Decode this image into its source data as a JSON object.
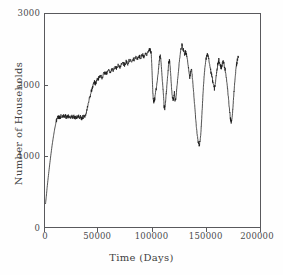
{
  "chart_data": {
    "type": "line",
    "title": "",
    "xlabel": "Time (Days)",
    "ylabel": "Number of Households",
    "xlim": [
      0,
      200000
    ],
    "ylim": [
      0,
      3000
    ],
    "xticks": [
      0,
      50000,
      100000,
      150000,
      200000
    ],
    "xtick_labels": [
      "0",
      "50000",
      "100000",
      "150000",
      "200000"
    ],
    "yticks": [
      0,
      1000,
      2000,
      3000
    ],
    "ytick_labels": [
      "0",
      "1000",
      "2000",
      "3000"
    ],
    "grid": false,
    "legend": false,
    "line_color": "#1a1a1a",
    "series": [
      {
        "name": "Number of Households",
        "x": [
          500,
          1200,
          2000,
          3000,
          4200,
          5400,
          6600,
          7800,
          9000,
          10200,
          11000,
          11800,
          12600,
          13400,
          14200,
          15000,
          16000,
          17000,
          18000,
          19000,
          20000,
          21000,
          22000,
          23000,
          24000,
          25000,
          26000,
          27000,
          28000,
          29000,
          30000,
          31000,
          32000,
          33000,
          34000,
          35000,
          36000,
          37000,
          38000,
          39000,
          40000,
          41000,
          42000,
          43000,
          44000,
          45000,
          46000,
          47000,
          48000,
          49000,
          50000,
          51500,
          53000,
          54500,
          56000,
          57500,
          59000,
          60500,
          62000,
          63500,
          65000,
          66500,
          68000,
          69500,
          71000,
          72500,
          74000,
          75500,
          77000,
          78500,
          80000,
          81500,
          83000,
          84500,
          86000,
          87500,
          89000,
          90500,
          92000,
          93500,
          95000,
          96000,
          97000,
          97800,
          98300,
          98800,
          99300,
          99800,
          100300,
          100800,
          101400,
          102000,
          102800,
          103600,
          104400,
          105200,
          106000,
          106600,
          107200,
          107800,
          108400,
          109000,
          109600,
          110200,
          110800,
          111400,
          112000,
          112600,
          113200,
          113800,
          114400,
          115000,
          115600,
          116200,
          116800,
          117400,
          118000,
          118600,
          119200,
          119800,
          120400,
          121000,
          121800,
          122600,
          123400,
          124200,
          125000,
          125800,
          126600,
          127400,
          128200,
          129000,
          129800,
          130600,
          131400,
          132200,
          133000,
          133800,
          134600,
          135400,
          136200,
          137000,
          137800,
          138600,
          139400,
          140200,
          141000,
          141800,
          142600,
          143400,
          144200,
          145000,
          145600,
          146200,
          146800,
          147400,
          148000,
          148800,
          149600,
          150400,
          151200,
          152000,
          152800,
          153600,
          154400,
          155200,
          156000,
          156800,
          157600,
          158400,
          159200,
          160000,
          160800,
          161600,
          162400,
          163200,
          164000,
          164800,
          165600,
          166400,
          167200,
          168000,
          168800,
          169600,
          170400,
          171200,
          172000,
          172600,
          173200,
          173800,
          174400,
          175000,
          175600,
          176200,
          176800,
          177400,
          178000,
          178600,
          179200,
          180000
        ],
        "y": [
          330,
          430,
          560,
          700,
          860,
          1010,
          1150,
          1270,
          1380,
          1470,
          1520,
          1548,
          1555,
          1540,
          1552,
          1558,
          1546,
          1560,
          1550,
          1562,
          1548,
          1566,
          1552,
          1558,
          1544,
          1562,
          1550,
          1556,
          1540,
          1554,
          1548,
          1560,
          1544,
          1552,
          1530,
          1545,
          1555,
          1562,
          1600,
          1660,
          1720,
          1790,
          1850,
          1910,
          1960,
          2010,
          2040,
          2020,
          2060,
          2080,
          2100,
          2130,
          2110,
          2150,
          2175,
          2160,
          2200,
          2180,
          2220,
          2205,
          2250,
          2230,
          2270,
          2250,
          2290,
          2310,
          2285,
          2330,
          2305,
          2350,
          2330,
          2370,
          2345,
          2390,
          2365,
          2410,
          2385,
          2430,
          2405,
          2450,
          2425,
          2470,
          2490,
          2510,
          2480,
          2440,
          2300,
          2100,
          1900,
          1790,
          1760,
          1800,
          1880,
          1960,
          2050,
          2160,
          2290,
          2380,
          2410,
          2350,
          2230,
          2100,
          1980,
          1860,
          1700,
          1660,
          1740,
          1850,
          1960,
          2080,
          2180,
          2290,
          2350,
          2300,
          2180,
          2040,
          1900,
          1800,
          1790,
          1830,
          1900,
          1760,
          1820,
          1950,
          2080,
          2200,
          2330,
          2430,
          2510,
          2560,
          2520,
          2480,
          2430,
          2470,
          2440,
          2390,
          2300,
          2200,
          2100,
          2180,
          2240,
          2120,
          1980,
          1830,
          1680,
          1520,
          1380,
          1270,
          1190,
          1150,
          1210,
          1320,
          1480,
          1650,
          1820,
          1980,
          2120,
          2250,
          2340,
          2400,
          2430,
          2390,
          2320,
          2250,
          2180,
          2130,
          2060,
          1990,
          1950,
          2020,
          2120,
          2220,
          2300,
          2350,
          2320,
          2280,
          2240,
          2290,
          2330,
          2300,
          2250,
          2180,
          2090,
          1980,
          1850,
          1720,
          1600,
          1520,
          1470,
          1510,
          1600,
          1720,
          1860,
          1980,
          2090,
          2180,
          2260,
          2320,
          2370,
          2400
        ]
      }
    ],
    "annotations": {
      "initial_value": 330,
      "first_plateau_level": 1550,
      "first_plateau_range": [
        11000,
        35000
      ],
      "peak_value": 2560,
      "peak_x": 127400,
      "minimum_after_peak": 1150,
      "minimum_x": 143400,
      "final_value": 2400,
      "final_x": 180000
    }
  },
  "axes": {
    "y_label": "Number of Households",
    "x_label": "Time (Days)",
    "y_ticks": [
      {
        "label": "3000",
        "value": 3000
      },
      {
        "label": "2000",
        "value": 2000
      },
      {
        "label": "1000",
        "value": 1000
      },
      {
        "label": "0",
        "value": 0
      }
    ],
    "x_ticks": [
      {
        "label": "0",
        "value": 0
      },
      {
        "label": "50000",
        "value": 50000
      },
      {
        "label": "100000",
        "value": 100000
      },
      {
        "label": "150000",
        "value": 150000
      },
      {
        "label": "200000",
        "value": 200000
      }
    ]
  },
  "caption": {
    "sliver_text": ""
  }
}
